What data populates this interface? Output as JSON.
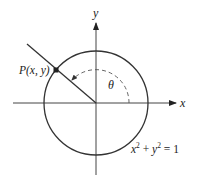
{
  "figure": {
    "axes": {
      "x_label": "x",
      "y_label": "y"
    },
    "point_label": "P(x, y)",
    "angle_label": "θ",
    "equation": {
      "base_x": "x",
      "exp_x": "2",
      "plus": " + ",
      "base_y": "y",
      "exp_y": "2",
      "rhs": " = 1"
    },
    "colors": {
      "stroke": "#333333",
      "background": "#ffffff"
    }
  }
}
